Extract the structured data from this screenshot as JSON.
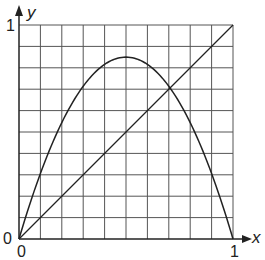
{
  "chart_data": {
    "type": "line",
    "title": "",
    "xlabel": "x",
    "ylabel": "y",
    "xlim": [
      0,
      1
    ],
    "ylim": [
      0,
      1
    ],
    "grid": true,
    "grid_divisions": 10,
    "tick_labels": {
      "x": [
        "0",
        "1"
      ],
      "y": [
        "0",
        "1"
      ]
    },
    "series": [
      {
        "name": "logistic map y = r x (1 - x)",
        "r": 3.4,
        "x": [
          0,
          0.1,
          0.2,
          0.3,
          0.4,
          0.5,
          0.6,
          0.7,
          0.8,
          0.9,
          1.0
        ],
        "values": [
          0,
          0.306,
          0.544,
          0.714,
          0.816,
          0.85,
          0.816,
          0.714,
          0.544,
          0.306,
          0
        ]
      },
      {
        "name": "diagonal y = x",
        "x": [
          0,
          1
        ],
        "values": [
          0,
          1
        ]
      }
    ],
    "annotations": [
      {
        "type": "fixed-point",
        "x": 0.706,
        "y": 0.706
      }
    ]
  },
  "labels": {
    "y_axis": "y",
    "x_axis": "x",
    "y_one": "1",
    "y_zero": "0",
    "x_zero": "0",
    "x_one": "1"
  },
  "colors": {
    "grid": "#555555",
    "axis": "#222222",
    "curve": "#222222"
  }
}
